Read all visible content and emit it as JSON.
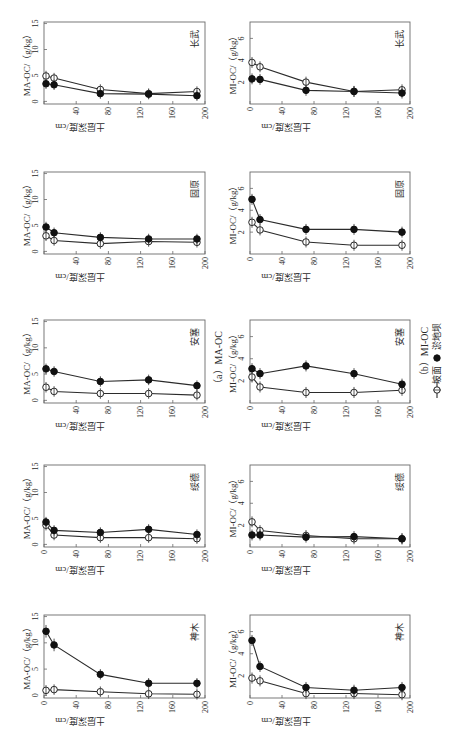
{
  "figure": {
    "panel_labels": {
      "a": "（a）MA-OC",
      "b": "（b）MI-OC"
    },
    "legend": [
      {
        "label": "坡面",
        "marker": "open-circle"
      },
      {
        "label": "淤地坝",
        "marker": "filled-circle"
      }
    ]
  },
  "chart_data": [
    {
      "type": "line",
      "group": "MA-OC",
      "title": "长武",
      "xlabel": "土层深度/cm",
      "ylabel": "MA-OC/（g/kg）",
      "x": [
        2.5,
        12.5,
        70,
        130,
        190
      ],
      "xlim": [
        0,
        200
      ],
      "ylim": [
        -0.5,
        15.3
      ],
      "xticks": [
        0,
        40,
        80,
        120,
        160,
        200
      ],
      "xticklabels": [
        "",
        "40",
        "80",
        "120",
        "160",
        "200"
      ],
      "yticks": [
        0,
        5,
        10,
        15
      ],
      "yticklabels": [
        "0",
        "5",
        "10",
        "15"
      ],
      "series": [
        {
          "name": "坡面",
          "marker": "open",
          "values": [
            4.9,
            4.5,
            2.3,
            1.5,
            1.9
          ],
          "error": [
            1.0,
            1.0,
            1.0,
            1.0,
            1.0
          ]
        },
        {
          "name": "淤地坝",
          "marker": "filled",
          "values": [
            3.4,
            3.2,
            1.5,
            1.4,
            1.1
          ],
          "error": [
            1.0,
            1.0,
            1.0,
            1.0,
            1.0
          ]
        }
      ]
    },
    {
      "type": "line",
      "group": "MI-OC",
      "title": "长武",
      "xlabel": "土层深度/cm",
      "ylabel": "MI-OC/（g/kg）",
      "x": [
        2.5,
        12.5,
        70,
        130,
        190
      ],
      "xlim": [
        0,
        200
      ],
      "ylim": [
        0,
        7.5
      ],
      "xticks": [
        0,
        40,
        80,
        120,
        160,
        200
      ],
      "xticklabels": [
        "0",
        "40",
        "80",
        "120",
        "160",
        "200"
      ],
      "yticks": [
        2,
        4,
        6
      ],
      "yticklabels": [
        "2",
        "4",
        "6"
      ],
      "series": [
        {
          "name": "坡面",
          "marker": "open",
          "values": [
            3.8,
            3.4,
            2.0,
            1.15,
            1.3
          ],
          "error": [
            0.5,
            0.5,
            0.5,
            0.5,
            0.5
          ]
        },
        {
          "name": "淤地坝",
          "marker": "filled",
          "values": [
            2.3,
            2.25,
            1.25,
            1.15,
            1.0
          ],
          "error": [
            0.5,
            0.5,
            0.5,
            0.5,
            0.5
          ]
        }
      ]
    },
    {
      "type": "line",
      "group": "MA-OC",
      "title": "固原",
      "xlabel": "土层深度/cm",
      "ylabel": "MA-OC/（g/kg）",
      "x": [
        2.5,
        12.5,
        70,
        130,
        190
      ],
      "xlim": [
        0,
        200
      ],
      "ylim": [
        -0.5,
        15.3
      ],
      "xticks": [
        0,
        40,
        80,
        120,
        160,
        200
      ],
      "xticklabels": [
        "",
        "40",
        "80",
        "120",
        "160",
        "200"
      ],
      "yticks": [
        0,
        5,
        10,
        15
      ],
      "yticklabels": [
        "0",
        "5",
        "10",
        "15"
      ],
      "series": [
        {
          "name": "坡面",
          "marker": "open",
          "values": [
            3.0,
            2.1,
            1.5,
            1.9,
            1.75
          ],
          "error": [
            1.0,
            1.0,
            1.0,
            1.0,
            1.0
          ]
        },
        {
          "name": "淤地坝",
          "marker": "filled",
          "values": [
            4.7,
            3.6,
            2.7,
            2.4,
            2.4
          ],
          "error": [
            1.0,
            1.0,
            1.0,
            1.0,
            1.0
          ]
        }
      ]
    },
    {
      "type": "line",
      "group": "MI-OC",
      "title": "固原",
      "xlabel": "土层深度/cm",
      "ylabel": "MI-OC/（g/kg）",
      "x": [
        2.5,
        12.5,
        70,
        130,
        190
      ],
      "xlim": [
        0,
        200
      ],
      "ylim": [
        0,
        7.5
      ],
      "xticks": [
        0,
        40,
        80,
        120,
        160,
        200
      ],
      "xticklabels": [
        "0",
        "40",
        "80",
        "120",
        "160",
        "200"
      ],
      "yticks": [
        2,
        4,
        6
      ],
      "yticklabels": [
        "2",
        "4",
        "6"
      ],
      "series": [
        {
          "name": "坡面",
          "marker": "open",
          "values": [
            2.9,
            2.2,
            1.1,
            0.8,
            0.8
          ],
          "error": [
            0.5,
            0.5,
            0.5,
            0.5,
            0.5
          ]
        },
        {
          "name": "淤地坝",
          "marker": "filled",
          "values": [
            5.0,
            3.15,
            2.25,
            2.25,
            2.0
          ],
          "error": [
            0.5,
            0.5,
            0.5,
            0.5,
            0.5
          ]
        }
      ]
    },
    {
      "type": "line",
      "group": "MA-OC",
      "title": "安塞",
      "xlabel": "土层深度/cm",
      "ylabel": "MA-OC/（g/kg）",
      "x": [
        2.5,
        12.5,
        70,
        130,
        190
      ],
      "xlim": [
        0,
        200
      ],
      "ylim": [
        -0.5,
        15.3
      ],
      "xticks": [
        0,
        40,
        80,
        120,
        160,
        200
      ],
      "xticklabels": [
        "",
        "40",
        "80",
        "120",
        "160",
        "200"
      ],
      "yticks": [
        0,
        5,
        10,
        15
      ],
      "yticklabels": [
        "0",
        "5",
        "10",
        "15"
      ],
      "series": [
        {
          "name": "坡面",
          "marker": "open",
          "values": [
            2.5,
            1.7,
            1.3,
            1.3,
            1.0
          ],
          "error": [
            1.0,
            1.0,
            1.0,
            1.0,
            1.0
          ]
        },
        {
          "name": "淤地坝",
          "marker": "filled",
          "values": [
            6.0,
            5.5,
            3.6,
            3.9,
            2.8
          ],
          "error": [
            1.0,
            1.0,
            1.0,
            1.0,
            1.0
          ]
        }
      ]
    },
    {
      "type": "line",
      "group": "MI-OC",
      "title": "安塞",
      "xlabel": "土层深度/cm",
      "ylabel": "MI-OC/（g/kg）",
      "x": [
        2.5,
        12.5,
        70,
        130,
        190
      ],
      "xlim": [
        0,
        200
      ],
      "ylim": [
        0,
        7.5
      ],
      "xticks": [
        0,
        40,
        80,
        120,
        160,
        200
      ],
      "xticklabels": [
        "0",
        "40",
        "80",
        "120",
        "160",
        "200"
      ],
      "yticks": [
        2,
        4,
        6
      ],
      "yticklabels": [
        "2",
        "4",
        "6"
      ],
      "series": [
        {
          "name": "坡面",
          "marker": "open",
          "values": [
            2.35,
            1.45,
            0.95,
            0.95,
            1.15
          ],
          "error": [
            0.5,
            0.5,
            0.5,
            0.5,
            0.5
          ]
        },
        {
          "name": "淤地坝",
          "marker": "filled",
          "values": [
            3.1,
            2.65,
            3.35,
            2.65,
            1.7
          ],
          "error": [
            0.5,
            0.5,
            0.5,
            0.5,
            0.5
          ]
        }
      ]
    },
    {
      "type": "line",
      "group": "MA-OC",
      "title": "绥德",
      "xlabel": "土层深度/cm",
      "ylabel": "MA-OC/（g/kg）",
      "x": [
        2.5,
        12.5,
        70,
        130,
        190
      ],
      "xlim": [
        0,
        200
      ],
      "ylim": [
        -0.5,
        15.3
      ],
      "xticks": [
        0,
        40,
        80,
        120,
        160,
        200
      ],
      "xticklabels": [
        "0",
        "40",
        "80",
        "120",
        "160",
        "200"
      ],
      "yticks": [
        0,
        5,
        10,
        15
      ],
      "yticklabels": [
        "0",
        "5",
        "10",
        "15"
      ],
      "series": [
        {
          "name": "坡面",
          "marker": "open",
          "values": [
            3.7,
            1.8,
            1.3,
            1.3,
            1.1
          ],
          "error": [
            1.0,
            1.0,
            1.0,
            1.0,
            1.0
          ]
        },
        {
          "name": "淤地坝",
          "marker": "filled",
          "values": [
            4.3,
            2.7,
            2.3,
            2.9,
            1.9
          ],
          "error": [
            1.0,
            1.0,
            1.0,
            1.0,
            1.0
          ]
        }
      ]
    },
    {
      "type": "line",
      "group": "MI-OC",
      "title": "绥德",
      "xlabel": "土层深度/cm",
      "ylabel": "MI-OC/（g/kg）",
      "x": [
        2.5,
        12.5,
        70,
        130,
        190
      ],
      "xlim": [
        0,
        200
      ],
      "ylim": [
        0,
        7.5
      ],
      "xticks": [
        0,
        40,
        80,
        120,
        160,
        200
      ],
      "xticklabels": [
        "0",
        "40",
        "80",
        "120",
        "160",
        "200"
      ],
      "yticks": [
        2,
        4,
        6
      ],
      "yticklabels": [
        "2",
        "4",
        "6"
      ],
      "series": [
        {
          "name": "坡面",
          "marker": "open",
          "values": [
            2.3,
            1.5,
            1.05,
            0.75,
            0.75
          ],
          "error": [
            0.5,
            0.5,
            0.5,
            0.5,
            0.5
          ]
        },
        {
          "name": "淤地坝",
          "marker": "filled",
          "values": [
            1.1,
            1.1,
            0.9,
            0.95,
            0.75
          ],
          "error": [
            0.5,
            0.5,
            0.5,
            0.5,
            0.5
          ]
        }
      ]
    },
    {
      "type": "line",
      "group": "MA-OC",
      "title": "神木",
      "xlabel": "土层深度/cm",
      "ylabel": "MA-OC/（g/kg）",
      "x": [
        2.5,
        12.5,
        70,
        130,
        190
      ],
      "xlim": [
        0,
        200
      ],
      "ylim": [
        -0.5,
        15.3
      ],
      "xticks": [
        0,
        40,
        80,
        120,
        160,
        200
      ],
      "xticklabels": [
        "0",
        "40",
        "80",
        "120",
        "160",
        "200"
      ],
      "yticks": [
        0,
        5,
        10,
        15
      ],
      "yticklabels": [
        "0",
        "5",
        "10",
        "15"
      ],
      "series": [
        {
          "name": "坡面",
          "marker": "open",
          "values": [
            0.95,
            1.1,
            0.7,
            0.3,
            0.2
          ],
          "error": [
            1.0,
            1.0,
            1.0,
            1.0,
            1.0
          ]
        },
        {
          "name": "淤地坝",
          "marker": "filled",
          "values": [
            12.2,
            9.6,
            4.0,
            2.3,
            2.3
          ],
          "error": [
            1.2,
            1.2,
            1.0,
            1.0,
            1.0
          ]
        }
      ]
    },
    {
      "type": "line",
      "group": "MI-OC",
      "title": "神木",
      "xlabel": "土层深度/cm",
      "ylabel": "MI-OC/（g/kg）",
      "x": [
        2.5,
        12.5,
        70,
        130,
        190
      ],
      "xlim": [
        0,
        200
      ],
      "ylim": [
        0,
        7.5
      ],
      "xticks": [
        0,
        40,
        80,
        120,
        160,
        200
      ],
      "xticklabels": [
        "0",
        "40",
        "80",
        "120",
        "160",
        "200"
      ],
      "yticks": [
        2,
        4,
        6
      ],
      "yticklabels": [
        "2",
        "4",
        "6"
      ],
      "series": [
        {
          "name": "坡面",
          "marker": "open",
          "values": [
            1.8,
            1.55,
            0.4,
            0.4,
            0.3
          ],
          "error": [
            0.5,
            0.5,
            0.5,
            0.5,
            0.5
          ]
        },
        {
          "name": "淤地坝",
          "marker": "filled",
          "values": [
            5.2,
            2.85,
            0.95,
            0.7,
            0.95
          ],
          "error": [
            0.5,
            0.5,
            0.5,
            0.5,
            0.5
          ]
        }
      ]
    }
  ]
}
